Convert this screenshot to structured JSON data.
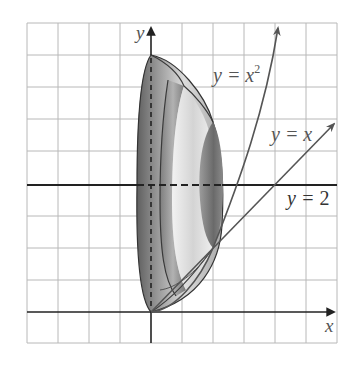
{
  "figure": {
    "type": "solid of revolution illustration",
    "grid": {
      "columns": 10,
      "rows": 10,
      "cell_px": 31,
      "color": "#b5b5b5"
    },
    "axes": {
      "x_label": "x",
      "y_label": "y"
    },
    "curves": [
      {
        "name": "parabola",
        "label_main": "y = x",
        "label_exp": "2",
        "equation": "y = x^2"
      },
      {
        "name": "line",
        "label_main": "y = x",
        "equation": "y = x"
      },
      {
        "name": "axis-of-rotation",
        "label_main": "y = ",
        "label_num": "2",
        "equation": "y = 2"
      }
    ],
    "colors": {
      "curve": "#555555",
      "axis": "#222222",
      "solid_dark": "#6e6e6e",
      "solid_light": "#e6e6e6"
    }
  }
}
